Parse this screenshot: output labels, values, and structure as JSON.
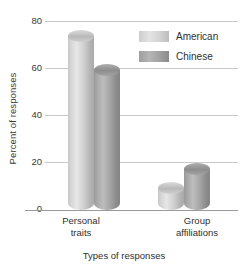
{
  "chart_data": {
    "type": "bar",
    "title": "",
    "xlabel": "Types of responses",
    "ylabel": "Percent of responses",
    "categories": [
      "Personal traits",
      "Group affiliations"
    ],
    "category_lines": [
      [
        "Personal",
        "traits"
      ],
      [
        "Group",
        "affiliations"
      ]
    ],
    "series": [
      {
        "name": "American",
        "values": [
          76,
          12
        ],
        "color": "#d2d2d2"
      },
      {
        "name": "Chinese",
        "values": [
          62,
          20
        ],
        "color": "#9a9a9a"
      }
    ],
    "ylim": [
      0,
      80
    ],
    "yticks": [
      0,
      20,
      40,
      60,
      80
    ],
    "ytick_labels": [
      "0",
      "20",
      "40",
      "60",
      "80"
    ],
    "grid": true,
    "legend_position": "top-right",
    "bar_style": "3d-cylinder"
  },
  "axes": {
    "y_title": "Percent of responses",
    "x_title": "Types of responses",
    "ticks": [
      {
        "label": "80",
        "value": 80
      },
      {
        "label": "60",
        "value": 60
      },
      {
        "label": "40",
        "value": 40
      },
      {
        "label": "20",
        "value": 20
      },
      {
        "label": "0",
        "value": 0
      }
    ]
  },
  "legend": {
    "items": [
      {
        "label": "American",
        "swatch": "american-swatch"
      },
      {
        "label": "Chinese",
        "swatch": "chinese-swatch"
      }
    ]
  },
  "groups": [
    {
      "line1": "Personal",
      "line2": "traits",
      "bars": [
        {
          "series": "American",
          "value": 76
        },
        {
          "series": "Chinese",
          "value": 62
        }
      ]
    },
    {
      "line1": "Group",
      "line2": "affiliations",
      "bars": [
        {
          "series": "American",
          "value": 12
        },
        {
          "series": "Chinese",
          "value": 20
        }
      ]
    }
  ]
}
